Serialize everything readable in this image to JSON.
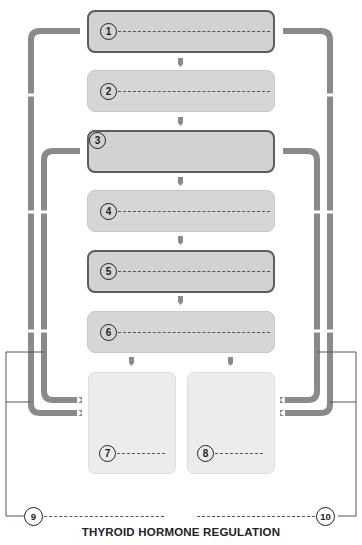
{
  "diagram": {
    "title": "THYROID HORMONE REGULATION",
    "colors": {
      "connector": "#8a8a8a",
      "dark_box_fill": "#d2d2d2",
      "dark_box_border": "#5c5c5c",
      "light_box_fill": "#d6d6d6",
      "pale_box_fill": "#ececec",
      "thin_line": "#555555"
    },
    "boxes": [
      {
        "id": 1,
        "label": "1",
        "style": "dark"
      },
      {
        "id": 2,
        "label": "2",
        "style": "light"
      },
      {
        "id": 3,
        "label": "3",
        "style": "dark"
      },
      {
        "id": 4,
        "label": "4",
        "style": "light"
      },
      {
        "id": 5,
        "label": "5",
        "style": "dark"
      },
      {
        "id": 6,
        "label": "6",
        "style": "light"
      },
      {
        "id": 7,
        "label": "7",
        "style": "pale"
      },
      {
        "id": 8,
        "label": "8",
        "style": "pale"
      }
    ],
    "callouts": [
      {
        "id": 9,
        "label": "9"
      },
      {
        "id": 10,
        "label": "10"
      }
    ]
  }
}
